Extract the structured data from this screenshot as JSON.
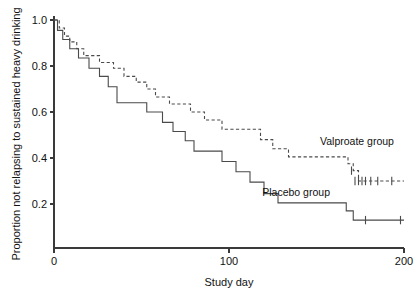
{
  "chart_data": {
    "type": "line",
    "title": "",
    "subtitle": "",
    "xlabel": "Study day",
    "ylabel": "Proportion not relapsing to sustained heavy drinking",
    "xlim": [
      0,
      200
    ],
    "ylim": [
      0.0,
      1.05
    ],
    "xticks": [
      0,
      100,
      200
    ],
    "xticklabels": [
      "0",
      "100",
      "200"
    ],
    "yticks": [
      0.2,
      0.4,
      0.6,
      0.8,
      1.0
    ],
    "yticklabels": [
      "0.2",
      "0.4",
      "0.6",
      "0.8",
      "1.0"
    ],
    "grid": false,
    "legend_position": "inline-annotation",
    "series": [
      {
        "name": "Valproate group",
        "style": "dashed",
        "color": "#4a4a4a",
        "label_x": 152,
        "label_y": 0.455,
        "points": [
          [
            0,
            1.0
          ],
          [
            3,
            1.0
          ],
          [
            3,
            0.965
          ],
          [
            6,
            0.965
          ],
          [
            6,
            0.93
          ],
          [
            9,
            0.93
          ],
          [
            9,
            0.905
          ],
          [
            13,
            0.905
          ],
          [
            13,
            0.875
          ],
          [
            17,
            0.875
          ],
          [
            17,
            0.845
          ],
          [
            26,
            0.845
          ],
          [
            26,
            0.815
          ],
          [
            34,
            0.815
          ],
          [
            34,
            0.79
          ],
          [
            40,
            0.79
          ],
          [
            40,
            0.755
          ],
          [
            47,
            0.755
          ],
          [
            47,
            0.73
          ],
          [
            53,
            0.73
          ],
          [
            53,
            0.7
          ],
          [
            58,
            0.7
          ],
          [
            58,
            0.665
          ],
          [
            66,
            0.665
          ],
          [
            66,
            0.635
          ],
          [
            78,
            0.635
          ],
          [
            78,
            0.6
          ],
          [
            86,
            0.6
          ],
          [
            86,
            0.565
          ],
          [
            96,
            0.565
          ],
          [
            96,
            0.525
          ],
          [
            118,
            0.525
          ],
          [
            118,
            0.48
          ],
          [
            125,
            0.48
          ],
          [
            125,
            0.44
          ],
          [
            134,
            0.44
          ],
          [
            134,
            0.405
          ],
          [
            168,
            0.405
          ],
          [
            168,
            0.375
          ],
          [
            171,
            0.375
          ],
          [
            171,
            0.345
          ],
          [
            174,
            0.345
          ],
          [
            174,
            0.3
          ],
          [
            200,
            0.3
          ]
        ],
        "censored": [
          [
            170,
            0.345
          ],
          [
            172,
            0.3
          ],
          [
            174,
            0.3
          ],
          [
            176,
            0.3
          ],
          [
            178,
            0.3
          ],
          [
            181,
            0.3
          ],
          [
            185,
            0.3
          ],
          [
            193,
            0.3
          ]
        ]
      },
      {
        "name": "Placebo group",
        "style": "solid",
        "color": "#4a4a4a",
        "label_x": 119,
        "label_y": 0.235,
        "points": [
          [
            0,
            1.0
          ],
          [
            2,
            1.0
          ],
          [
            2,
            0.955
          ],
          [
            5,
            0.955
          ],
          [
            5,
            0.915
          ],
          [
            9,
            0.915
          ],
          [
            9,
            0.875
          ],
          [
            14,
            0.875
          ],
          [
            14,
            0.835
          ],
          [
            20,
            0.835
          ],
          [
            20,
            0.79
          ],
          [
            26,
            0.79
          ],
          [
            26,
            0.755
          ],
          [
            31,
            0.755
          ],
          [
            31,
            0.71
          ],
          [
            36,
            0.71
          ],
          [
            36,
            0.64
          ],
          [
            53,
            0.64
          ],
          [
            53,
            0.6
          ],
          [
            62,
            0.6
          ],
          [
            62,
            0.555
          ],
          [
            68,
            0.555
          ],
          [
            68,
            0.515
          ],
          [
            75,
            0.515
          ],
          [
            75,
            0.475
          ],
          [
            80,
            0.475
          ],
          [
            80,
            0.43
          ],
          [
            96,
            0.43
          ],
          [
            96,
            0.385
          ],
          [
            104,
            0.385
          ],
          [
            104,
            0.34
          ],
          [
            112,
            0.34
          ],
          [
            112,
            0.295
          ],
          [
            120,
            0.295
          ],
          [
            120,
            0.245
          ],
          [
            128,
            0.245
          ],
          [
            128,
            0.205
          ],
          [
            167,
            0.205
          ],
          [
            167,
            0.17
          ],
          [
            171,
            0.17
          ],
          [
            171,
            0.13
          ],
          [
            200,
            0.13
          ]
        ],
        "censored": [
          [
            178,
            0.13
          ],
          [
            198,
            0.13
          ]
        ]
      }
    ]
  },
  "axes": {
    "x_title": "Study day",
    "y_title": "Proportion not relapsing to sustained heavy drinking"
  },
  "labels": {
    "valproate": "Valproate group",
    "placebo": "Placebo group"
  },
  "ticks": {
    "x": [
      "0",
      "100",
      "200"
    ],
    "y": [
      "0.2",
      "0.4",
      "0.6",
      "0.8",
      "1.0"
    ]
  }
}
